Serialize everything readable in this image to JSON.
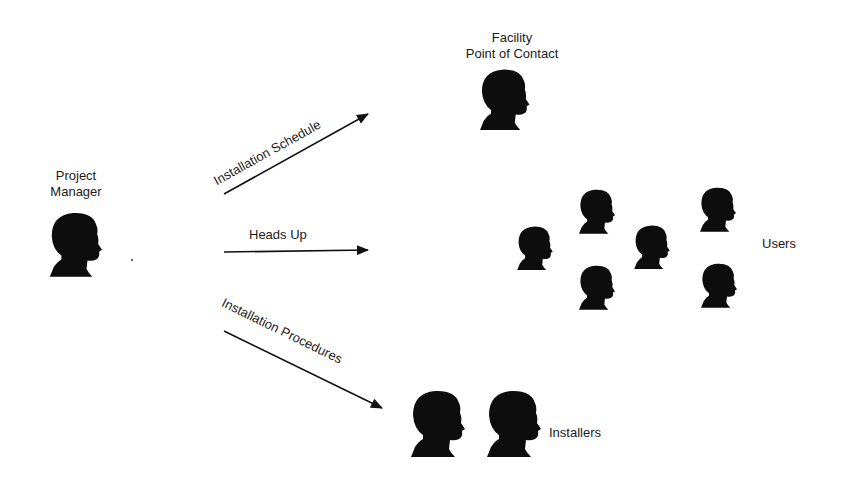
{
  "diagram": {
    "nodes": {
      "project_manager": {
        "line1": "Project",
        "line2": "Manager"
      },
      "facility_poc": {
        "line1": "Facility",
        "line2": "Point of Contact"
      },
      "users": {
        "label": "Users",
        "count": 6
      },
      "installers": {
        "label": "Installers",
        "count": 2
      }
    },
    "edges": {
      "schedule": {
        "label": "Installation Schedule",
        "from": "Project Manager",
        "to": "Facility Point of Contact"
      },
      "heads_up": {
        "label": "Heads Up",
        "from": "Project Manager",
        "to": "Users"
      },
      "procedures": {
        "label": "Installation Procedures",
        "from": "Project Manager",
        "to": "Installers"
      }
    },
    "colors": {
      "silhouette": "#0d0d0d",
      "arrow": "#111111",
      "background": "#ffffff"
    }
  }
}
